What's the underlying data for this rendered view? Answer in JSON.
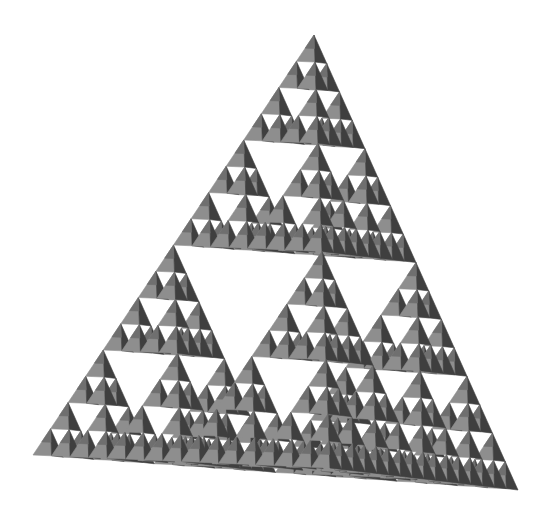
{
  "figure": {
    "colors": {
      "background": "#ffffff",
      "face_light": "#8e8e8e",
      "face_mid": "#6f6f6f",
      "face_dark": "#3f3f3f",
      "hole": "#ffffff"
    },
    "vertices": {
      "apex": [
        314,
        35
      ],
      "left": [
        33,
        455
      ],
      "front": [
        330,
        468
      ],
      "right": [
        518,
        490
      ]
    },
    "recursion_depth": 4
  }
}
